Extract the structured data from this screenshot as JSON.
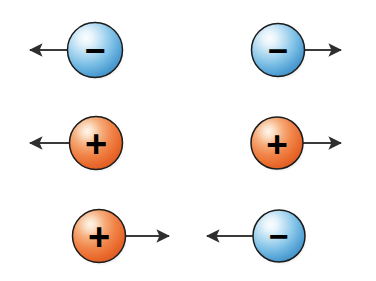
{
  "figure": {
    "title": "Charged particles with velocity arrows",
    "canvas": {
      "width": 376,
      "height": 281,
      "background": "#ffffff"
    }
  },
  "palette": {
    "negative_fill_light": "#f2f9fd",
    "negative_fill_mid": "#8ec8ec",
    "negative_fill_dark": "#3f8fc9",
    "negative_fill_edge": "#2f6f9e",
    "positive_fill_light": "#fdf0e2",
    "positive_fill_mid": "#f0894a",
    "positive_fill_dark": "#de5a22",
    "positive_fill_edge": "#b4441a",
    "outline": "#1c1c1c",
    "arrow": "#3a3a3a",
    "sign_glyph": "#000000"
  },
  "particles": [
    {
      "id": "particle-1",
      "row": 1,
      "column": "left",
      "charge": "negative",
      "sign_label": "−",
      "color_name": "blue",
      "cx": 95,
      "cy": 50,
      "r": 27.5,
      "arrow": {
        "direction": "left",
        "from_x": 95,
        "to_x": 29,
        "y": 50,
        "length": 66
      }
    },
    {
      "id": "particle-2",
      "row": 1,
      "column": "right",
      "charge": "negative",
      "sign_label": "−",
      "color_name": "blue",
      "cx": 278,
      "cy": 50,
      "r": 26.5,
      "arrow": {
        "direction": "right",
        "from_x": 278,
        "to_x": 342,
        "y": 50,
        "length": 64
      }
    },
    {
      "id": "particle-3",
      "row": 2,
      "column": "left",
      "charge": "positive",
      "sign_label": "+",
      "color_name": "orange",
      "cx": 96,
      "cy": 143,
      "r": 26.5,
      "arrow": {
        "direction": "left",
        "from_x": 96,
        "to_x": 29,
        "y": 143,
        "length": 67
      }
    },
    {
      "id": "particle-4",
      "row": 2,
      "column": "right",
      "charge": "positive",
      "sign_label": "+",
      "color_name": "orange",
      "cx": 277,
      "cy": 143,
      "r": 26.0,
      "arrow": {
        "direction": "right",
        "from_x": 277,
        "to_x": 342,
        "y": 143,
        "length": 65
      }
    },
    {
      "id": "particle-5",
      "row": 3,
      "column": "left",
      "charge": "positive",
      "sign_label": "+",
      "color_name": "orange",
      "cx": 99,
      "cy": 236,
      "r": 26.5,
      "arrow": {
        "direction": "right",
        "from_x": 99,
        "to_x": 170,
        "y": 236,
        "length": 71
      }
    },
    {
      "id": "particle-6",
      "row": 3,
      "column": "right",
      "charge": "negative",
      "sign_label": "−",
      "color_name": "blue",
      "cx": 279,
      "cy": 236,
      "r": 26.0,
      "arrow": {
        "direction": "left",
        "from_x": 279,
        "to_x": 206,
        "y": 236,
        "length": 73
      }
    }
  ]
}
